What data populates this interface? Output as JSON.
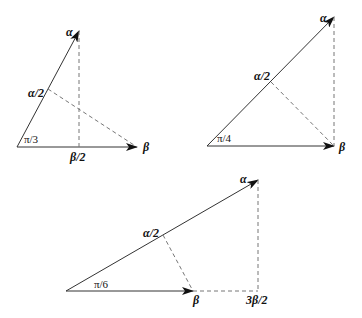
{
  "figure": {
    "panels": [
      {
        "id": "pi-over-3",
        "angle_label": "π/3",
        "alpha_label": "α",
        "beta_label": "β",
        "half_alpha_label": "α/2",
        "projection_label": "β/2"
      },
      {
        "id": "pi-over-4",
        "angle_label": "π/4",
        "alpha_label": "α",
        "beta_label": "β",
        "half_alpha_label": "α/2"
      },
      {
        "id": "pi-over-6",
        "angle_label": "π/6",
        "alpha_label": "α",
        "beta_label": "β",
        "half_alpha_label": "α/2",
        "projection_label": "3β/2"
      }
    ]
  }
}
